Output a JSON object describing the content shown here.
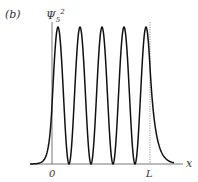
{
  "panel_label": "(b)",
  "y_label_base": "Ψ",
  "y_label_sub": "5",
  "y_label_sup": "2",
  "x_label": "x",
  "tick_zero": "0",
  "tick_L": "L",
  "colors": {
    "curve": "#111111",
    "axis": "#555555",
    "text": "#333333"
  },
  "chart_data": {
    "type": "line",
    "title": "(b)",
    "xlabel": "x",
    "ylabel": "Ψ5²",
    "n": 5,
    "x_ticks": [
      "0",
      "L"
    ],
    "xlim": [
      -0.22,
      1.22
    ],
    "ylim": [
      0,
      1
    ],
    "grid": false,
    "legend": "none"
  }
}
